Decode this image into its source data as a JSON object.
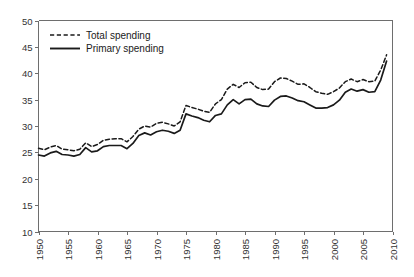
{
  "chart_data": {
    "type": "line",
    "title": "",
    "subtitle": "",
    "xlabel": "",
    "ylabel": "",
    "xlim": [
      1950,
      2010
    ],
    "ylim": [
      10,
      50
    ],
    "grid": false,
    "legend_position": "top-left",
    "y_ticks": [
      10,
      15,
      20,
      25,
      30,
      35,
      40,
      45,
      50
    ],
    "y_tick_labels": [
      "10",
      "15",
      "20",
      "25",
      "30",
      "35",
      "40",
      "45",
      "50"
    ],
    "x_ticks": [
      1950,
      1955,
      1960,
      1965,
      1970,
      1975,
      1980,
      1985,
      1990,
      1995,
      2000,
      2005,
      2010
    ],
    "x_tick_labels": [
      "1950",
      "1955",
      "1960",
      "1965",
      "1970",
      "1975",
      "1980",
      "1985",
      "1990",
      "1995",
      "2000",
      "2005",
      "2010"
    ],
    "x": [
      1950,
      1951,
      1952,
      1953,
      1954,
      1955,
      1956,
      1957,
      1958,
      1959,
      1960,
      1961,
      1962,
      1963,
      1964,
      1965,
      1966,
      1967,
      1968,
      1969,
      1970,
      1971,
      1972,
      1973,
      1974,
      1975,
      1976,
      1977,
      1978,
      1979,
      1980,
      1981,
      1982,
      1983,
      1984,
      1985,
      1986,
      1987,
      1988,
      1989,
      1990,
      1991,
      1992,
      1993,
      1994,
      1995,
      1996,
      1997,
      1998,
      1999,
      2000,
      2001,
      2002,
      2003,
      2004,
      2005,
      2006,
      2007,
      2008,
      2009
    ],
    "series": [
      {
        "name": "Total spending",
        "style": "dashed",
        "color": "#1a1a1a",
        "values": [
          25.8,
          25.5,
          26.0,
          26.3,
          25.6,
          25.5,
          25.3,
          25.6,
          26.8,
          26.1,
          26.5,
          27.3,
          27.5,
          27.6,
          27.6,
          27.0,
          28.0,
          29.4,
          30.0,
          29.8,
          30.5,
          30.7,
          30.4,
          30.0,
          30.8,
          33.9,
          33.5,
          33.2,
          32.8,
          32.6,
          34.2,
          35.0,
          37.0,
          37.9,
          37.3,
          38.2,
          38.3,
          37.3,
          36.9,
          37.0,
          38.4,
          39.1,
          39.0,
          38.5,
          37.9,
          38.0,
          37.3,
          36.5,
          36.2,
          36.0,
          36.5,
          37.2,
          38.4,
          38.9,
          38.4,
          38.8,
          38.4,
          38.5,
          40.6,
          43.5
        ]
      },
      {
        "name": "Primary spending",
        "style": "solid",
        "color": "#1a1a1a",
        "values": [
          24.5,
          24.3,
          24.9,
          25.2,
          24.6,
          24.5,
          24.3,
          24.6,
          25.9,
          25.1,
          25.3,
          26.1,
          26.3,
          26.3,
          26.3,
          25.7,
          26.7,
          28.2,
          28.7,
          28.3,
          28.9,
          29.2,
          29.0,
          28.6,
          29.2,
          32.3,
          31.9,
          31.6,
          31.1,
          30.8,
          32.0,
          32.3,
          34.0,
          35.0,
          34.2,
          35.0,
          35.1,
          34.2,
          33.8,
          33.7,
          34.9,
          35.6,
          35.7,
          35.3,
          34.8,
          34.6,
          34.0,
          33.4,
          33.4,
          33.5,
          34.0,
          34.9,
          36.4,
          37.0,
          36.6,
          36.9,
          36.4,
          36.5,
          38.7,
          42.3
        ]
      }
    ],
    "legend": [
      {
        "label": "Total spending",
        "style": "dashed"
      },
      {
        "label": "Primary spending",
        "style": "solid"
      }
    ]
  }
}
